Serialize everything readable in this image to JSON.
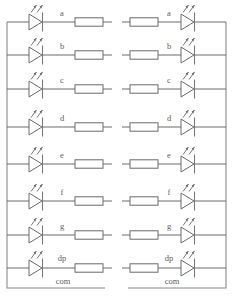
{
  "diagram": {
    "segments": [
      "a",
      "b",
      "c",
      "d",
      "e",
      "f",
      "g",
      "dp"
    ],
    "common_label": "com",
    "colors": {
      "wire": "#6a6a6a",
      "bus": "#8a8a8a",
      "background": "#ffffff",
      "label_text": "#5d5d5d"
    },
    "left_circuit": {
      "name": "common-anode-group",
      "common_label": "com",
      "order": [
        "led",
        "resistor"
      ],
      "rows": [
        {
          "segment": "a",
          "led": "led-symbol",
          "resistor": "resistor-symbol"
        },
        {
          "segment": "b",
          "led": "led-symbol",
          "resistor": "resistor-symbol"
        },
        {
          "segment": "c",
          "led": "led-symbol",
          "resistor": "resistor-symbol"
        },
        {
          "segment": "d",
          "led": "led-symbol",
          "resistor": "resistor-symbol"
        },
        {
          "segment": "e",
          "led": "led-symbol",
          "resistor": "resistor-symbol"
        },
        {
          "segment": "f",
          "led": "led-symbol",
          "resistor": "resistor-symbol"
        },
        {
          "segment": "g",
          "led": "led-symbol",
          "resistor": "resistor-symbol"
        },
        {
          "segment": "dp",
          "led": "led-symbol",
          "resistor": "resistor-symbol"
        }
      ]
    },
    "right_circuit": {
      "name": "common-cathode-group",
      "common_label": "com",
      "order": [
        "resistor",
        "led"
      ],
      "rows": [
        {
          "segment": "a",
          "resistor": "resistor-symbol",
          "led": "led-symbol"
        },
        {
          "segment": "b",
          "resistor": "resistor-symbol",
          "led": "led-symbol"
        },
        {
          "segment": "c",
          "resistor": "resistor-symbol",
          "led": "led-symbol"
        },
        {
          "segment": "d",
          "resistor": "resistor-symbol",
          "led": "led-symbol"
        },
        {
          "segment": "e",
          "resistor": "resistor-symbol",
          "led": "led-symbol"
        },
        {
          "segment": "f",
          "resistor": "resistor-symbol",
          "led": "led-symbol"
        },
        {
          "segment": "g",
          "resistor": "resistor-symbol",
          "led": "led-symbol"
        },
        {
          "segment": "dp",
          "resistor": "resistor-symbol",
          "led": "led-symbol"
        }
      ]
    }
  }
}
